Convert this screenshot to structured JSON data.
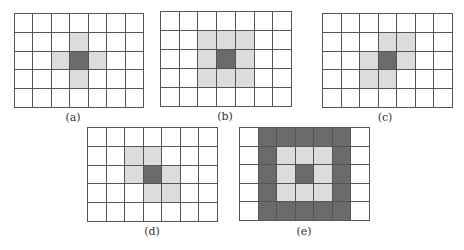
{
  "figure": {
    "colors": {
      "grid_line": "#555555",
      "empty": "#ffffff",
      "neighbor": "#dcdcdc",
      "center": "#6b6b6b"
    },
    "legend": {
      "0": "empty",
      "1": "neighbor (light gray)",
      "2": "center / dark"
    },
    "panels": [
      {
        "id": "a",
        "caption": "(a)",
        "cols": 7,
        "rows": 5,
        "box": {
          "x": 14,
          "y": 13,
          "w": 130,
          "h": 95
        },
        "caption_pos": {
          "x": 73,
          "y": 111
        },
        "cells": [
          [
            0,
            0,
            0,
            0,
            0,
            0,
            0
          ],
          [
            0,
            0,
            0,
            1,
            0,
            0,
            0
          ],
          [
            0,
            0,
            1,
            2,
            1,
            0,
            0
          ],
          [
            0,
            0,
            0,
            1,
            0,
            0,
            0
          ],
          [
            0,
            0,
            0,
            0,
            0,
            0,
            0
          ]
        ]
      },
      {
        "id": "b",
        "caption": "(b)",
        "cols": 7,
        "rows": 5,
        "box": {
          "x": 160,
          "y": 11,
          "w": 132,
          "h": 96
        },
        "caption_pos": {
          "x": 225,
          "y": 110
        },
        "cells": [
          [
            0,
            0,
            0,
            0,
            0,
            0,
            0
          ],
          [
            0,
            0,
            1,
            1,
            1,
            0,
            0
          ],
          [
            0,
            0,
            1,
            2,
            1,
            0,
            0
          ],
          [
            0,
            0,
            1,
            1,
            1,
            0,
            0
          ],
          [
            0,
            0,
            0,
            0,
            0,
            0,
            0
          ]
        ]
      },
      {
        "id": "c",
        "caption": "(c)",
        "cols": 7,
        "rows": 5,
        "box": {
          "x": 322,
          "y": 13,
          "w": 131,
          "h": 95
        },
        "caption_pos": {
          "x": 385,
          "y": 111
        },
        "cells": [
          [
            0,
            0,
            0,
            0,
            0,
            0,
            0
          ],
          [
            0,
            0,
            0,
            1,
            1,
            0,
            0
          ],
          [
            0,
            0,
            1,
            2,
            1,
            0,
            0
          ],
          [
            0,
            0,
            1,
            1,
            0,
            0,
            0
          ],
          [
            0,
            0,
            0,
            0,
            0,
            0,
            0
          ]
        ]
      },
      {
        "id": "d",
        "caption": "(d)",
        "cols": 7,
        "rows": 5,
        "box": {
          "x": 87,
          "y": 127,
          "w": 131,
          "h": 95
        },
        "caption_pos": {
          "x": 152,
          "y": 225
        },
        "cells": [
          [
            0,
            0,
            0,
            0,
            0,
            0,
            0
          ],
          [
            0,
            0,
            1,
            1,
            0,
            0,
            0
          ],
          [
            0,
            0,
            1,
            2,
            1,
            0,
            0
          ],
          [
            0,
            0,
            0,
            1,
            1,
            0,
            0
          ],
          [
            0,
            0,
            0,
            0,
            0,
            0,
            0
          ]
        ]
      },
      {
        "id": "e",
        "caption": "(e)",
        "cols": 7,
        "rows": 5,
        "box": {
          "x": 239,
          "y": 127,
          "w": 131,
          "h": 94
        },
        "caption_pos": {
          "x": 304,
          "y": 225
        },
        "cells": [
          [
            0,
            2,
            2,
            2,
            2,
            2,
            0
          ],
          [
            0,
            2,
            1,
            1,
            1,
            2,
            0
          ],
          [
            0,
            2,
            1,
            2,
            1,
            2,
            0
          ],
          [
            0,
            2,
            1,
            1,
            1,
            2,
            0
          ],
          [
            0,
            2,
            2,
            2,
            2,
            2,
            0
          ]
        ]
      }
    ]
  }
}
